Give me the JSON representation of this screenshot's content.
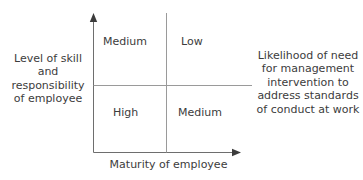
{
  "diagram": {
    "title_present": false,
    "axes": {
      "y_axis_label": "Level of skill\nand\nresponsibility\nof employee",
      "y_axis_label_lines": [
        "Level of skill",
        "and",
        "responsibility",
        "of employee"
      ],
      "x_axis_label": "Maturity of employee",
      "right_annotation_lines": [
        "Likelihood of need",
        "for management",
        "intervention to",
        "address standards",
        "of conduct at work"
      ],
      "right_annotation": "Likelihood of need for management intervention to address standards of conduct at work"
    },
    "quadrants": {
      "top_left": "Medium",
      "top_right": "Low",
      "bottom_left": "High",
      "bottom_right": "Medium"
    },
    "colors": {
      "axis_line": "#6e6e6e",
      "divider_line": "#9a9a9a",
      "text": "#3c3c3c",
      "background": "#ffffff"
    }
  }
}
